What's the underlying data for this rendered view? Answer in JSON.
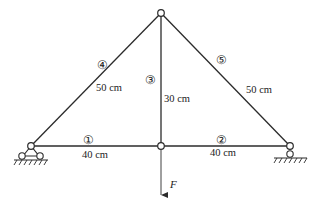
{
  "diagram": {
    "type": "truss",
    "colors": {
      "line": "#2b2b2b",
      "background": "#ffffff"
    },
    "nodes": {
      "top": [
        161,
        13
      ],
      "left": [
        31,
        146
      ],
      "middle": [
        161,
        146
      ],
      "right": [
        290,
        146
      ]
    },
    "members": [
      {
        "id": "1",
        "symbol": "①",
        "length": "40 cm"
      },
      {
        "id": "2",
        "symbol": "②",
        "length": "40 cm"
      },
      {
        "id": "3",
        "symbol": "③",
        "length": "30 cm"
      },
      {
        "id": "4",
        "symbol": "④",
        "length": "50 cm"
      },
      {
        "id": "5",
        "symbol": "⑤",
        "length": "50 cm"
      }
    ],
    "load": {
      "label": "F",
      "direction": "down"
    },
    "supports": {
      "left": "pinned",
      "right": "roller"
    }
  }
}
